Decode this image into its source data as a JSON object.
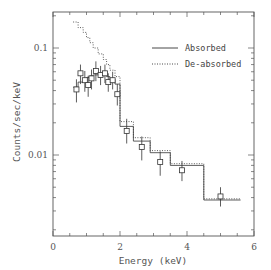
{
  "chart_data": {
    "type": "line",
    "title": "",
    "xlabel": "Energy (keV)",
    "ylabel": "Counts/sec/keV",
    "xlim": [
      0,
      6
    ],
    "ylim": [
      0.003,
      0.25
    ],
    "yscale": "log",
    "grid": false,
    "legend_position": "upper right",
    "x_ticks": [
      0,
      2,
      4,
      6
    ],
    "x_tick_labels": [
      "0",
      "2",
      "4",
      "6"
    ],
    "y_ticks": [
      0.01,
      0.1
    ],
    "y_tick_labels": [
      "0.01",
      "0.1"
    ],
    "series": [
      {
        "name": "Absorbed",
        "style": "solid step",
        "bins": [
          {
            "x0": 0.6,
            "x1": 0.75,
            "y": 0.043
          },
          {
            "x0": 0.75,
            "x1": 0.9,
            "y": 0.048
          },
          {
            "x0": 0.9,
            "x1": 1.0,
            "y": 0.052
          },
          {
            "x0": 1.0,
            "x1": 1.1,
            "y": 0.053
          },
          {
            "x0": 1.1,
            "x1": 1.2,
            "y": 0.055
          },
          {
            "x0": 1.2,
            "x1": 1.35,
            "y": 0.056
          },
          {
            "x0": 1.35,
            "x1": 1.5,
            "y": 0.057
          },
          {
            "x0": 1.5,
            "x1": 1.6,
            "y": 0.056
          },
          {
            "x0": 1.6,
            "x1": 1.7,
            "y": 0.054
          },
          {
            "x0": 1.7,
            "x1": 1.85,
            "y": 0.051
          },
          {
            "x0": 1.85,
            "x1": 2.0,
            "y": 0.046
          },
          {
            "x0": 2.0,
            "x1": 2.4,
            "y": 0.0185
          },
          {
            "x0": 2.4,
            "x1": 2.9,
            "y": 0.0135
          },
          {
            "x0": 2.9,
            "x1": 3.5,
            "y": 0.0105
          },
          {
            "x0": 3.5,
            "x1": 4.5,
            "y": 0.008
          },
          {
            "x0": 4.5,
            "x1": 5.6,
            "y": 0.0038
          }
        ]
      },
      {
        "name": "De-absorbed",
        "style": "dotted step",
        "bins": [
          {
            "x0": 0.6,
            "x1": 0.75,
            "y": 0.175
          },
          {
            "x0": 0.75,
            "x1": 0.9,
            "y": 0.155
          },
          {
            "x0": 0.9,
            "x1": 1.0,
            "y": 0.14
          },
          {
            "x0": 1.0,
            "x1": 1.1,
            "y": 0.125
          },
          {
            "x0": 1.1,
            "x1": 1.2,
            "y": 0.112
          },
          {
            "x0": 1.2,
            "x1": 1.35,
            "y": 0.1
          },
          {
            "x0": 1.35,
            "x1": 1.5,
            "y": 0.088
          },
          {
            "x0": 1.5,
            "x1": 1.6,
            "y": 0.078
          },
          {
            "x0": 1.6,
            "x1": 1.7,
            "y": 0.07
          },
          {
            "x0": 1.7,
            "x1": 1.85,
            "y": 0.062
          },
          {
            "x0": 1.85,
            "x1": 2.0,
            "y": 0.054
          },
          {
            "x0": 2.0,
            "x1": 2.4,
            "y": 0.0205
          },
          {
            "x0": 2.4,
            "x1": 2.9,
            "y": 0.0145
          },
          {
            "x0": 2.9,
            "x1": 3.5,
            "y": 0.011
          },
          {
            "x0": 3.5,
            "x1": 4.5,
            "y": 0.0083
          },
          {
            "x0": 4.5,
            "x1": 5.6,
            "y": 0.0039
          }
        ]
      },
      {
        "name": "Data",
        "style": "open squares with error bars",
        "points": [
          {
            "x": 0.7,
            "y": 0.041,
            "yerr_lo": 0.01,
            "yerr_hi": 0.01
          },
          {
            "x": 0.82,
            "y": 0.058,
            "yerr_lo": 0.012,
            "yerr_hi": 0.012
          },
          {
            "x": 0.95,
            "y": 0.05,
            "yerr_lo": 0.011,
            "yerr_hi": 0.011
          },
          {
            "x": 1.05,
            "y": 0.045,
            "yerr_lo": 0.01,
            "yerr_hi": 0.01
          },
          {
            "x": 1.15,
            "y": 0.052,
            "yerr_lo": 0.011,
            "yerr_hi": 0.011
          },
          {
            "x": 1.28,
            "y": 0.061,
            "yerr_lo": 0.012,
            "yerr_hi": 0.014
          },
          {
            "x": 1.42,
            "y": 0.056,
            "yerr_lo": 0.011,
            "yerr_hi": 0.012
          },
          {
            "x": 1.55,
            "y": 0.058,
            "yerr_lo": 0.011,
            "yerr_hi": 0.012
          },
          {
            "x": 1.65,
            "y": 0.048,
            "yerr_lo": 0.009,
            "yerr_hi": 0.01
          },
          {
            "x": 1.78,
            "y": 0.05,
            "yerr_lo": 0.009,
            "yerr_hi": 0.01
          },
          {
            "x": 1.92,
            "y": 0.037,
            "yerr_lo": 0.008,
            "yerr_hi": 0.009
          },
          {
            "x": 2.2,
            "y": 0.0168,
            "yerr_lo": 0.004,
            "yerr_hi": 0.005
          },
          {
            "x": 2.65,
            "y": 0.0119,
            "yerr_lo": 0.003,
            "yerr_hi": 0.003
          },
          {
            "x": 3.2,
            "y": 0.0086,
            "yerr_lo": 0.0022,
            "yerr_hi": 0.0022
          },
          {
            "x": 3.85,
            "y": 0.0072,
            "yerr_lo": 0.0015,
            "yerr_hi": 0.0016
          },
          {
            "x": 5.0,
            "y": 0.0041,
            "yerr_lo": 0.0008,
            "yerr_hi": 0.0009
          }
        ]
      }
    ]
  },
  "legend": {
    "items": [
      {
        "label": "Absorbed",
        "style": "solid"
      },
      {
        "label": "De-absorbed",
        "style": "dotted"
      }
    ]
  },
  "colors": {
    "axis": "#555555",
    "line": "#333333",
    "background": "#ffffff"
  }
}
